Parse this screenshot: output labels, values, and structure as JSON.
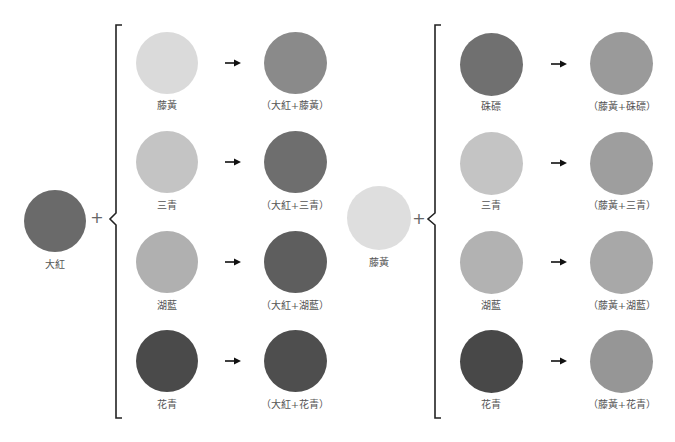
{
  "groups": [
    {
      "base": {
        "label": "大紅",
        "color": "#6a6a6a"
      },
      "operator": "+",
      "rows": [
        {
          "input": {
            "label": "藤黃",
            "color": "#dadada"
          },
          "result": {
            "label": "（大紅+藤黃）",
            "color": "#8a8a8a"
          }
        },
        {
          "input": {
            "label": "三青",
            "color": "#c4c4c4"
          },
          "result": {
            "label": "（大紅+三青）",
            "color": "#6e6e6e"
          }
        },
        {
          "input": {
            "label": "湖藍",
            "color": "#b0b0b0"
          },
          "result": {
            "label": "（大紅+湖藍）",
            "color": "#5e5e5e"
          }
        },
        {
          "input": {
            "label": "花青",
            "color": "#4a4a4a"
          },
          "result": {
            "label": "（大紅+花青）",
            "color": "#4e4e4e"
          }
        }
      ]
    },
    {
      "base": {
        "label": "藤黃",
        "color": "#dedede"
      },
      "operator": "+",
      "rows": [
        {
          "input": {
            "label": "硃磦",
            "color": "#707070"
          },
          "result": {
            "label": "（藤黃+硃磦）",
            "color": "#9a9a9a"
          }
        },
        {
          "input": {
            "label": "三青",
            "color": "#c4c4c4"
          },
          "result": {
            "label": "（藤黃+三青）",
            "color": "#9e9e9e"
          }
        },
        {
          "input": {
            "label": "湖藍",
            "color": "#b2b2b2"
          },
          "result": {
            "label": "（藤黃+湖藍）",
            "color": "#a8a8a8"
          }
        },
        {
          "input": {
            "label": "花青",
            "color": "#484848"
          },
          "result": {
            "label": "（藤黃+花青）",
            "color": "#969696"
          }
        }
      ]
    }
  ]
}
